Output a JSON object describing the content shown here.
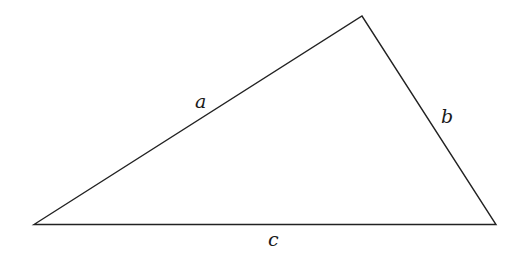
{
  "diagram": {
    "type": "triangle",
    "vertices": {
      "top": [
        362,
        16
      ],
      "left": [
        34,
        224
      ],
      "right": [
        496,
        224
      ]
    },
    "stroke_color": "#222222",
    "sides": [
      {
        "name": "a",
        "label": "a",
        "from": "left",
        "to": "top"
      },
      {
        "name": "b",
        "label": "b",
        "from": "top",
        "to": "right"
      },
      {
        "name": "c",
        "label": "c",
        "from": "left",
        "to": "right"
      }
    ]
  }
}
